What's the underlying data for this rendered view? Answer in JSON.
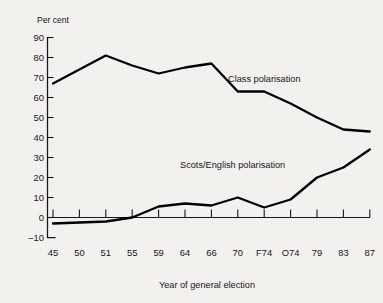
{
  "chart_data": {
    "type": "line",
    "title": "",
    "xlabel": "Year of general election",
    "ylabel": "Per cent",
    "categories": [
      "45",
      "50",
      "51",
      "55",
      "59",
      "64",
      "66",
      "70",
      "F74",
      "O74",
      "79",
      "83",
      "87"
    ],
    "ylim": [
      -10,
      90
    ],
    "yticks": [
      -10,
      0,
      10,
      20,
      30,
      40,
      50,
      60,
      70,
      80,
      90
    ],
    "ytick_labels": [
      "–10",
      "0",
      "10",
      "20",
      "30",
      "40",
      "50",
      "60",
      "70",
      "80",
      "90"
    ],
    "grid": false,
    "legend_position": "inline-annotation",
    "series": [
      {
        "name": "Class polarisation",
        "values": [
          67,
          74,
          81,
          76,
          72,
          75,
          77,
          63,
          63,
          57,
          50,
          44,
          43
        ],
        "color": "#000000",
        "label_x": "66",
        "label_y": 70
      },
      {
        "name": "Scots/English polarisation",
        "values": [
          -3,
          -2.5,
          -2,
          0,
          5.5,
          7,
          6,
          10,
          5,
          9,
          20,
          25,
          34
        ],
        "color": "#000000",
        "label_x": "64",
        "label_y": 31
      }
    ]
  },
  "axes": {
    "y_axis_name": "Per cent",
    "x_axis_title": "Year of general election"
  },
  "annotations": {
    "class_label": "Class polarisation",
    "scots_label": "Scots/English polarisation"
  },
  "ytick_labels": {
    "t90": "90",
    "t80": "80",
    "t70": "70",
    "t60": "60",
    "t50": "50",
    "t40": "40",
    "t30": "30",
    "t20": "20",
    "t10": "10",
    "t0": "0",
    "tm10": "–10"
  },
  "xtick_labels": {
    "x0": "45",
    "x1": "50",
    "x2": "51",
    "x3": "55",
    "x4": "59",
    "x5": "64",
    "x6": "66",
    "x7": "70",
    "x8": "F74",
    "x9": "O74",
    "x10": "79",
    "x11": "83",
    "x12": "87"
  },
  "colors": {
    "background": "#f2f1ee",
    "ink": "#17161a",
    "line": "#000000"
  }
}
